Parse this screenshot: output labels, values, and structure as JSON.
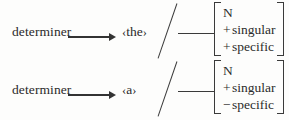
{
  "figure": {
    "rules": [
      {
        "lhs": "determiner",
        "arrow": "⟶",
        "terminal": "the",
        "bracket_open": "‹",
        "bracket_close": "›",
        "slash": "/",
        "blank": "—",
        "matrix": {
          "category": "N",
          "features": [
            {
              "sign": "+",
              "name": "singular"
            },
            {
              "sign": "+",
              "name": "specific"
            }
          ]
        }
      },
      {
        "lhs": "determiner",
        "arrow": "⟶",
        "terminal": "a",
        "bracket_open": "‹",
        "bracket_close": "›",
        "slash": "/",
        "blank": "—",
        "matrix": {
          "category": "N",
          "features": [
            {
              "sign": "+",
              "name": "singular"
            },
            {
              "sign": "−",
              "name": "specific"
            }
          ]
        }
      }
    ],
    "colors": {
      "ink": "#2b2b2b",
      "rule_line": "#3a3a3a",
      "background": "#fdfdfc"
    }
  }
}
